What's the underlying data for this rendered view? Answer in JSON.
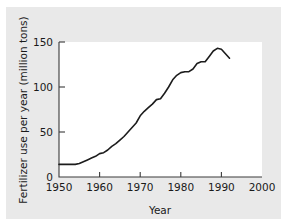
{
  "chart_data": {
    "type": "line",
    "title": "",
    "xlabel": "Year",
    "ylabel": "Fertilizer use per year (million tons)",
    "xlim": [
      1950,
      2000
    ],
    "ylim": [
      0,
      150
    ],
    "xticks": [
      1950,
      1960,
      1970,
      1980,
      1990,
      2000
    ],
    "xtick_labels": [
      "1950",
      "1960",
      "1970",
      "1980",
      "1990",
      "2000"
    ],
    "yticks": [
      0,
      50,
      100,
      150
    ],
    "ytick_labels": [
      "0",
      "50",
      "100",
      "150"
    ],
    "grid": false,
    "legend": false,
    "line_color": "#1c1c1c",
    "series": [
      {
        "name": "World fertilizer use",
        "x": [
          1950,
          1951,
          1952,
          1953,
          1954,
          1955,
          1956,
          1957,
          1958,
          1959,
          1960,
          1961,
          1962,
          1963,
          1964,
          1965,
          1966,
          1967,
          1968,
          1969,
          1970,
          1971,
          1972,
          1973,
          1974,
          1975,
          1976,
          1977,
          1978,
          1979,
          1980,
          1981,
          1982,
          1983,
          1984,
          1985,
          1986,
          1987,
          1988,
          1989,
          1990,
          1991,
          1992
        ],
        "values": [
          14,
          14,
          14,
          14,
          14,
          15,
          17,
          19,
          21,
          23,
          26,
          27,
          30,
          34,
          37,
          41,
          45,
          50,
          55,
          60,
          68,
          73,
          77,
          81,
          86,
          87,
          93,
          100,
          108,
          113,
          116,
          117,
          117,
          120,
          126,
          128,
          128,
          134,
          140,
          143,
          142,
          137,
          132
        ]
      }
    ]
  }
}
